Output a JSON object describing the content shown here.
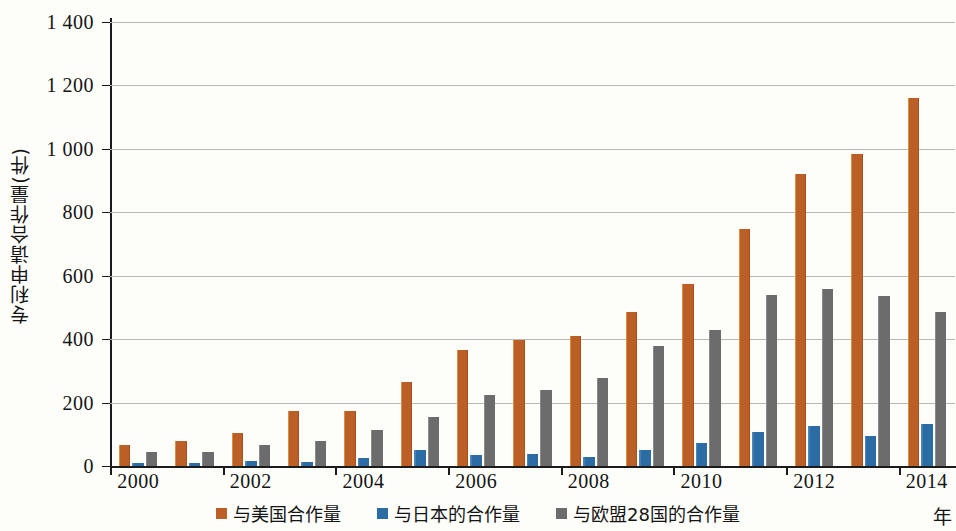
{
  "chart_data": {
    "type": "bar",
    "title": "",
    "subtitle": "",
    "xlabel": "年",
    "ylabel": "专利申请合作量(件)",
    "ylim": [
      0,
      1400
    ],
    "ytick_labels": [
      "0",
      "200",
      "400",
      "600",
      "800",
      "1 000",
      "1 200",
      "1 400"
    ],
    "ytick_values": [
      0,
      200,
      400,
      600,
      800,
      1000,
      1200,
      1400
    ],
    "grid": true,
    "legend_position": "bottom",
    "categories": [
      "2000",
      "2001",
      "2002",
      "2003",
      "2004",
      "2005",
      "2006",
      "2007",
      "2008",
      "2009",
      "2010",
      "2011",
      "2012",
      "2013",
      "2014"
    ],
    "xtick_labels": [
      "2000",
      "2002",
      "2004",
      "2006",
      "2008",
      "2010",
      "2012",
      "2014"
    ],
    "series": [
      {
        "name": "与美国合作量",
        "color": "#bb5f27",
        "values": [
          65,
          78,
          105,
          172,
          172,
          265,
          367,
          398,
          410,
          487,
          573,
          748,
          920,
          985,
          1160
        ]
      },
      {
        "name": "与日本的合作量",
        "color": "#2c6ca4",
        "values": [
          8,
          10,
          15,
          13,
          26,
          50,
          34,
          38,
          28,
          50,
          72,
          108,
          125,
          95,
          133
        ]
      },
      {
        "name": "与欧盟28国的合作量",
        "color": "#6c6c6c",
        "values": [
          45,
          45,
          67,
          80,
          112,
          155,
          224,
          241,
          279,
          379,
          430,
          538,
          558,
          535,
          487
        ]
      }
    ]
  },
  "axis": {
    "y_title": "专利申请合作量(件)",
    "x_unit": "年"
  }
}
